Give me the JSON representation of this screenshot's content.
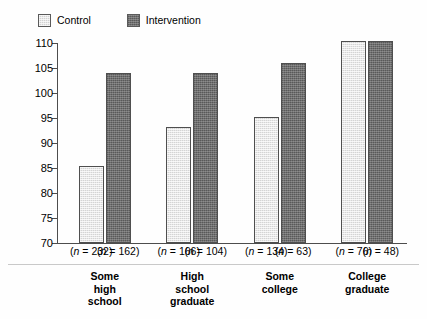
{
  "legend": {
    "entries": [
      {
        "label": "Control",
        "swatch": "light-gray-hatched",
        "color": "#d4d4d4"
      },
      {
        "label": "Intervention",
        "swatch": "dark-gray-hatched",
        "color": "#6f6f6f"
      }
    ]
  },
  "chart_data": {
    "type": "bar",
    "title": "",
    "xlabel": "",
    "ylabel": "",
    "ylim": [
      70,
      110
    ],
    "yticks": [
      70,
      75,
      80,
      85,
      90,
      95,
      100,
      105,
      110
    ],
    "ytick_labels": [
      "70",
      "75",
      "80",
      "85",
      "90",
      "95",
      "100",
      "105",
      "110"
    ],
    "grid": false,
    "legend_position": "top-left",
    "categories": [
      "Some\nhigh\nschool",
      "High\nschool\ngraduate",
      "Some\ncollege",
      "College\ngraduate"
    ],
    "series": [
      {
        "name": "Control",
        "values": [
          85.5,
          93.2,
          95.3,
          110.5
        ]
      },
      {
        "name": "Intervention",
        "values": [
          104.0,
          104.0,
          106.1,
          110.4
        ]
      }
    ],
    "annotations": {
      "n_labels": [
        "(n = 232)",
        "(n = 162)",
        "(n = 166)",
        "(n = 104)",
        "(n = 134)",
        "(n = 63)",
        "(n = 76)",
        "(n = 48)"
      ],
      "n_values": [
        232,
        162,
        166,
        104,
        134,
        63,
        76,
        48
      ]
    }
  }
}
